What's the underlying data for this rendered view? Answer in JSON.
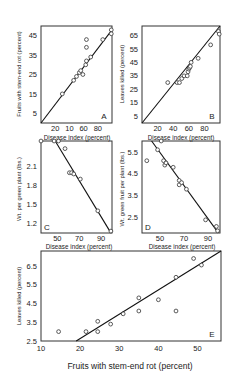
{
  "chart_data": [
    {
      "id": "A",
      "type": "scatter",
      "panel_label": "A",
      "xlabel": "Disease index (percent)",
      "ylabel": "Fruits with stem-end rot (percent)",
      "xticks": [
        "20",
        "10",
        "60",
        "80"
      ],
      "xtick_values": [
        20,
        40,
        60,
        80
      ],
      "yticks": [
        "5",
        "15",
        "25",
        "35",
        "45"
      ],
      "ytick_values": [
        5,
        15,
        25,
        35,
        45
      ],
      "xlim": [
        0,
        100
      ],
      "ylim": [
        0,
        50
      ],
      "points": [
        [
          30,
          15
        ],
        [
          46,
          22
        ],
        [
          50,
          24
        ],
        [
          54,
          26
        ],
        [
          56,
          27
        ],
        [
          59,
          25
        ],
        [
          63,
          30
        ],
        [
          64,
          32
        ],
        [
          64,
          43
        ],
        [
          64,
          39
        ],
        [
          70,
          34
        ],
        [
          87,
          43
        ],
        [
          99,
          48
        ],
        [
          99,
          46
        ]
      ],
      "fit_line": [
        [
          0,
          0
        ],
        [
          100,
          48
        ]
      ]
    },
    {
      "id": "B",
      "type": "scatter",
      "panel_label": "B",
      "xlabel": "Disease index (percent)",
      "ylabel": "Leaves killed (percent)",
      "xticks": [
        "20",
        "40",
        "60",
        "80"
      ],
      "xtick_values": [
        20,
        40,
        60,
        80
      ],
      "yticks": [
        "5",
        "15",
        "25",
        "35",
        "45",
        "55",
        "65"
      ],
      "ytick_values": [
        5,
        15,
        25,
        35,
        45,
        55,
        65
      ],
      "xlim": [
        0,
        100
      ],
      "ylim": [
        0,
        72
      ],
      "points": [
        [
          33,
          30
        ],
        [
          45,
          30
        ],
        [
          48,
          30
        ],
        [
          51,
          33
        ],
        [
          54,
          35
        ],
        [
          58,
          35
        ],
        [
          59,
          38
        ],
        [
          60,
          40
        ],
        [
          61,
          41
        ],
        [
          62,
          42
        ],
        [
          63,
          45
        ],
        [
          72,
          48
        ],
        [
          88,
          58
        ],
        [
          98,
          68
        ],
        [
          99,
          66
        ]
      ],
      "fit_line": [
        [
          0,
          0
        ],
        [
          100,
          72
        ]
      ]
    },
    {
      "id": "C",
      "type": "scatter",
      "panel_label": "C",
      "xlabel": "Disease index (percent)",
      "ylabel": "Wt. per green plant (lbs.)",
      "xticks": [
        "50",
        "70",
        "90"
      ],
      "xtick_values": [
        50,
        70,
        90
      ],
      "yticks": [
        "1.2",
        "1.5",
        "1.8",
        "2.1"
      ],
      "ytick_values": [
        1.2,
        1.5,
        1.8,
        2.1
      ],
      "xlim": [
        35,
        100
      ],
      "ylim": [
        1.05,
        2.5
      ],
      "points": [
        [
          35,
          2.5
        ],
        [
          47,
          2.5
        ],
        [
          51,
          2.5
        ],
        [
          57,
          2.38
        ],
        [
          61,
          2.0
        ],
        [
          63,
          2.0
        ],
        [
          65,
          1.98
        ],
        [
          71,
          1.9
        ],
        [
          87,
          1.4
        ],
        [
          99,
          1.08
        ]
      ],
      "fit_line": [
        [
          48,
          2.52
        ],
        [
          98,
          1.08
        ]
      ]
    },
    {
      "id": "D",
      "type": "scatter",
      "panel_label": "D",
      "xlabel": "Disease index (percent)",
      "ylabel": "Wt. green fruit per plant (lbs.)",
      "xticks": [
        "50",
        "70",
        "90"
      ],
      "xtick_values": [
        50,
        70,
        90
      ],
      "yticks": [
        "2.5",
        "3.5",
        "4.5",
        "5.5"
      ],
      "ytick_values": [
        2.5,
        3.5,
        4.5,
        5.5
      ],
      "xlim": [
        35,
        100
      ],
      "ylim": [
        1.8,
        6.0
      ],
      "points": [
        [
          39,
          5.1
        ],
        [
          48,
          5.6
        ],
        [
          51,
          6.0
        ],
        [
          53,
          5.1
        ],
        [
          54,
          4.9
        ],
        [
          55,
          5.0
        ],
        [
          61,
          4.8
        ],
        [
          66,
          4.2
        ],
        [
          66,
          4.0
        ],
        [
          68,
          4.1
        ],
        [
          72,
          3.8
        ],
        [
          88,
          2.4
        ],
        [
          97,
          2.1
        ],
        [
          98,
          1.9
        ]
      ],
      "fit_line": [
        [
          43,
          6.05
        ],
        [
          98,
          1.85
        ]
      ]
    },
    {
      "id": "E",
      "type": "scatter",
      "panel_label": "E",
      "xlabel": "Fruits with stem-end rot (percent)",
      "ylabel": "Leaves killed (percent)",
      "top_labels": [
        "Disease index (percent)",
        "Disease index (percent)"
      ],
      "xticks": [
        "10",
        "20",
        "30",
        "40",
        "50"
      ],
      "xtick_values": [
        10,
        20,
        30,
        40,
        50
      ],
      "yticks": [
        "2.5",
        "3.5",
        "4.5",
        "5.5",
        "6.5"
      ],
      "ytick_values": [
        2.5,
        3.5,
        4.5,
        5.5,
        6.5
      ],
      "xlim": [
        10,
        56
      ],
      "ylim": [
        2.5,
        7.3
      ],
      "points": [
        [
          14.5,
          3.0
        ],
        [
          21.5,
          3.0
        ],
        [
          24.5,
          3.0
        ],
        [
          24.5,
          3.55
        ],
        [
          27.8,
          3.4
        ],
        [
          31,
          3.95
        ],
        [
          35,
          4.1
        ],
        [
          35,
          4.8
        ],
        [
          40,
          4.7
        ],
        [
          44.5,
          4.1
        ],
        [
          44.5,
          5.9
        ],
        [
          49,
          6.9
        ],
        [
          51,
          6.55
        ]
      ],
      "fit_line": [
        [
          19,
          2.5
        ],
        [
          56,
          7.3
        ]
      ]
    }
  ]
}
